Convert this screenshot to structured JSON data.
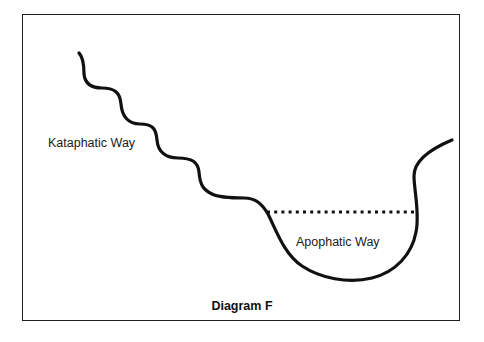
{
  "diagram": {
    "caption": "Diagram F",
    "labels": {
      "kataphatic": "Kataphatic Way",
      "apophatic": "Apophatic Way"
    },
    "elements": {
      "wavy_descent": "Wavy line descending from upper left (Kataphatic Way)",
      "bowl_curve": "U-shaped valley curve rising at right",
      "dotted_line": "Horizontal dotted line across top of valley"
    },
    "colors": {
      "line": "#111111",
      "frame": "#1e1e1e",
      "background": "#ffffff"
    }
  }
}
